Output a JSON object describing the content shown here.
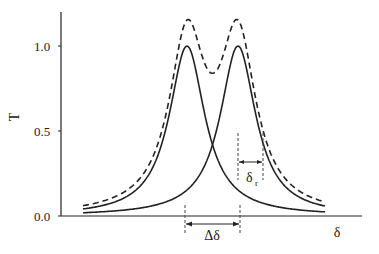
{
  "chart_data": {
    "type": "line",
    "title": "",
    "xlabel": "δ",
    "ylabel": "T",
    "yticks": [
      "0.0",
      "0.5",
      "1.0"
    ],
    "ylim": [
      0,
      1.2
    ],
    "grid": false,
    "legend": null,
    "series": [
      {
        "name": "resonance 1",
        "style": "solid",
        "center": 0,
        "peak": 1.0,
        "half_width": 0.425
      },
      {
        "name": "resonance 2",
        "style": "solid",
        "center": 1.0,
        "peak": 1.0,
        "half_width": 0.425
      },
      {
        "name": "sum",
        "style": "dashed",
        "peak": 1.15,
        "dip": 0.84
      }
    ],
    "annotations": {
      "delta_delta": "Δδ",
      "delta_r": "δ",
      "delta_r_sub": "r"
    }
  }
}
